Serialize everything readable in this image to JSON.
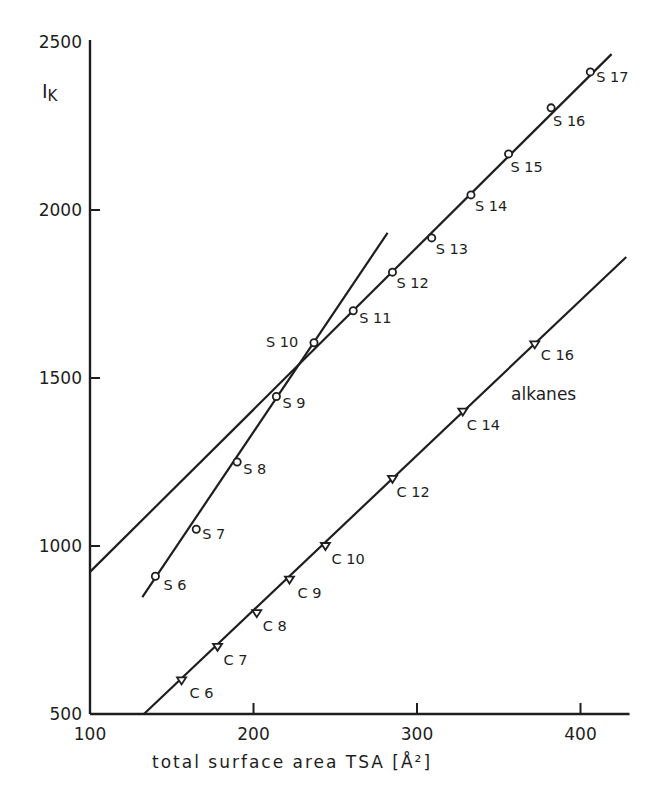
{
  "chart_data": {
    "type": "scatter",
    "title": "",
    "xlabel": "total surface area TSA [Å²]",
    "ylabel": "I_K",
    "ylabel_main": "I",
    "ylabel_sub": "K",
    "xlim": [
      100,
      430
    ],
    "ylim": [
      500,
      2500
    ],
    "x_ticks": [
      100,
      200,
      300,
      400
    ],
    "y_ticks": [
      500,
      1000,
      1500,
      2000,
      2500
    ],
    "grid": false,
    "legend": "none",
    "annotations": [
      {
        "text": "alkanes",
        "x": 380,
        "y": 1430
      }
    ],
    "series": [
      {
        "name": "S-series (circles)",
        "marker": "circle",
        "points": [
          {
            "label": "S6",
            "x": 140,
            "y": 910
          },
          {
            "label": "S7",
            "x": 165,
            "y": 1050
          },
          {
            "label": "S8",
            "x": 190,
            "y": 1250
          },
          {
            "label": "S9",
            "x": 214,
            "y": 1445
          },
          {
            "label": "S10",
            "x": 237,
            "y": 1605
          },
          {
            "label": "S11",
            "x": 261,
            "y": 1700
          },
          {
            "label": "S12",
            "x": 285,
            "y": 1815
          },
          {
            "label": "S13",
            "x": 309,
            "y": 1917
          },
          {
            "label": "S14",
            "x": 333,
            "y": 2045
          },
          {
            "label": "S15",
            "x": 356,
            "y": 2167
          },
          {
            "label": "S16",
            "x": 382,
            "y": 2304
          },
          {
            "label": "S17",
            "x": 406,
            "y": 2411
          }
        ]
      },
      {
        "name": "alkanes",
        "marker": "triangle-down",
        "points": [
          {
            "label": "C6",
            "x": 156,
            "y": 600
          },
          {
            "label": "C7",
            "x": 178,
            "y": 700
          },
          {
            "label": "C8",
            "x": 202,
            "y": 800
          },
          {
            "label": "C9",
            "x": 222,
            "y": 900
          },
          {
            "label": "C10",
            "x": 244,
            "y": 1000
          },
          {
            "label": "C12",
            "x": 285,
            "y": 1200
          },
          {
            "label": "C14",
            "x": 328,
            "y": 1400
          },
          {
            "label": "C16",
            "x": 372,
            "y": 1600
          }
        ]
      }
    ],
    "fit_lines": [
      {
        "name": "S-series fit (S9–S17)",
        "x1": 100,
        "y1": 923,
        "x2": 419,
        "y2": 2464
      },
      {
        "name": "S-series fit (S6–S10)",
        "x1": 132,
        "y1": 848,
        "x2": 282,
        "y2": 1932
      },
      {
        "name": "alkanes fit",
        "x1": 133,
        "y1": 500,
        "x2": 428,
        "y2": 1860
      }
    ]
  }
}
